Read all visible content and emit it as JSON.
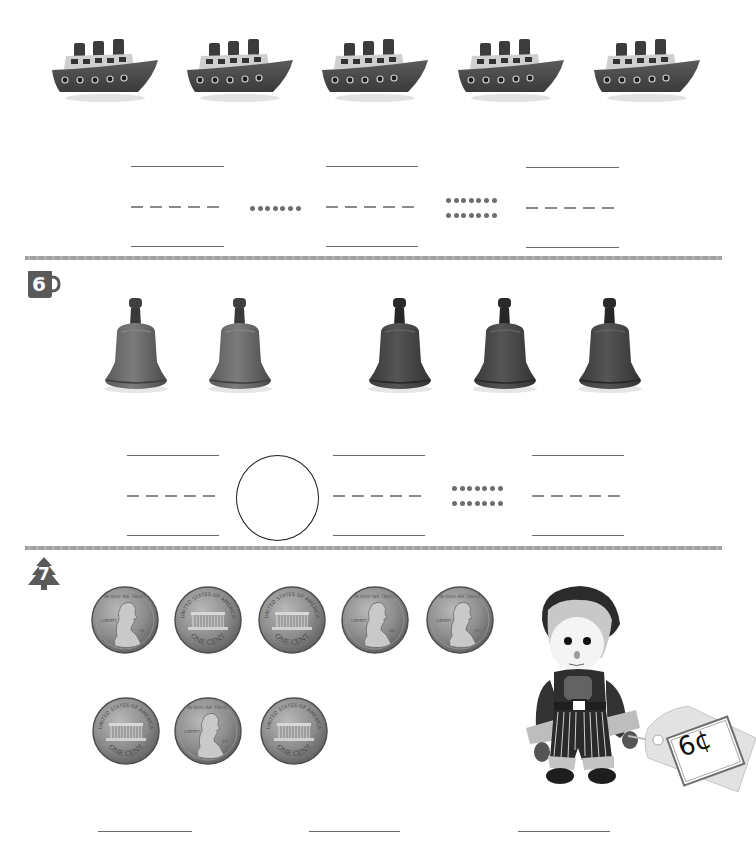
{
  "worksheet": {
    "section_5": {
      "items": {
        "type": "boat",
        "count": 5,
        "icon": "boat-icon"
      },
      "answer_groups": [
        {
          "top_line": "",
          "dashed_line": "",
          "bottom_line": ""
        },
        {
          "top_line": "",
          "dashed_line": "",
          "bottom_line": ""
        },
        {
          "top_line": "",
          "dashed_line": "",
          "bottom_line": ""
        }
      ],
      "operator_1": {
        "type": "dotted-line",
        "dot_rows": 1,
        "dots_per_row": 7
      },
      "operator_2": {
        "type": "dotted-equals",
        "dot_rows": 2,
        "dots_per_row": 7
      }
    },
    "section_6": {
      "badge": {
        "number": "6",
        "icon": "mug-badge-icon"
      },
      "items": {
        "type": "bell",
        "group_1_count": 2,
        "group_2_count": 3,
        "icon": "bell-icon"
      },
      "answer_groups": [
        {
          "top_line": "",
          "dashed_line": "",
          "bottom_line": ""
        },
        {
          "top_line": "",
          "dashed_line": "",
          "bottom_line": ""
        },
        {
          "top_line": "",
          "dashed_line": "",
          "bottom_line": ""
        }
      ],
      "operator_circle": {
        "value": ""
      },
      "operator_2": {
        "type": "dotted-equals",
        "dot_rows": 2,
        "dots_per_row": 7
      }
    },
    "section_7": {
      "badge": {
        "number": "7",
        "icon": "tree-badge-icon"
      },
      "coins": {
        "row_1": [
          "heads",
          "tails",
          "tails",
          "heads",
          "heads"
        ],
        "row_2": [
          "tails",
          "heads",
          "tails"
        ],
        "denomination": "ONE CENT",
        "obverse_legend": "IN GOD WE TRUST",
        "reverse_legend": "UNITED STATES OF AMERICA"
      },
      "toy": {
        "type": "knitted doll",
        "price_tag": "6¢"
      },
      "answer_lines": [
        "",
        "",
        ""
      ]
    },
    "colors": {
      "line": "#6b6b6b",
      "badge": "#5a5a5a",
      "separator": "#a8a8a8",
      "object_dark": "#3f3f3f"
    }
  }
}
